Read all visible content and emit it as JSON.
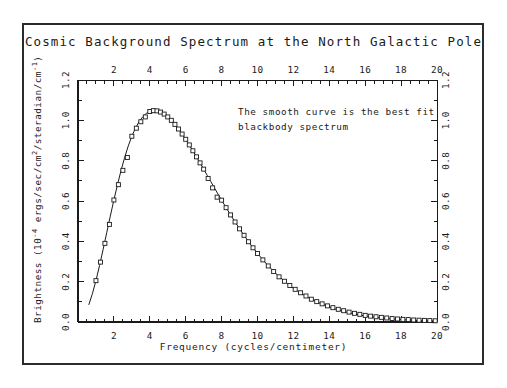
{
  "figure": {
    "title": "Cosmic Background Spectrum at the North Galactic Pole",
    "annotation_line1": "The smooth curve is the best fit",
    "annotation_line2": "blackbody spectrum"
  },
  "chart_data": {
    "type": "line",
    "title": "Cosmic Background Spectrum at the North Galactic Pole",
    "xlabel": "Frequency (cycles/centimeter)",
    "ylabel": "Brightness (10⁻⁴ ergs/sec/cm²/steradian/cm⁻¹)",
    "xlim": [
      0,
      20
    ],
    "ylim": [
      0.0,
      1.2
    ],
    "xticks": [
      2,
      4,
      6,
      8,
      10,
      12,
      14,
      16,
      18,
      20
    ],
    "xtick_labels": [
      "2",
      "4",
      "6",
      "8",
      "10",
      "12",
      "14",
      "16",
      "18",
      "20"
    ],
    "yticks": [
      0.0,
      0.2,
      0.4,
      0.6,
      0.8,
      1.0,
      1.2
    ],
    "ytick_labels": [
      "0.0",
      "0.2",
      "0.4",
      "0.6",
      "0.8",
      "1.0",
      "1.2"
    ],
    "x_minor_step": 0.5,
    "y_minor_step": 0.1,
    "grid": false,
    "legend": null,
    "top_axis_mirrored": true,
    "right_axis_mirrored": true,
    "annotations": [
      {
        "text": "The smooth curve is the best fit",
        "x": 11.2,
        "y": 1.02
      },
      {
        "text": "blackbody spectrum",
        "x": 11.2,
        "y": 0.94
      }
    ],
    "series": [
      {
        "name": "blackbody best fit",
        "style": "smooth-curve",
        "marker": "none",
        "x": [
          0.6,
          0.8,
          1.0,
          1.2,
          1.4,
          1.6,
          1.8,
          2.0,
          2.2,
          2.4,
          2.6,
          2.8,
          3.0,
          3.2,
          3.4,
          3.6,
          3.8,
          4.0,
          4.2,
          4.4,
          4.6,
          4.8,
          5.0,
          5.2,
          5.4,
          5.6,
          5.8,
          6.0,
          6.2,
          6.4,
          6.6,
          6.8,
          7.0,
          7.2,
          7.4,
          7.6,
          7.8,
          8.0,
          8.5,
          9.0,
          9.5,
          10.0,
          10.5,
          11.0,
          11.5,
          12.0,
          12.5,
          13.0,
          13.5,
          14.0,
          14.5,
          15.0,
          15.5,
          16.0,
          16.5,
          17.0,
          17.5,
          18.0,
          18.5,
          19.0,
          19.5,
          20.0
        ],
        "y": [
          0.085,
          0.14,
          0.205,
          0.28,
          0.36,
          0.443,
          0.525,
          0.605,
          0.681,
          0.752,
          0.816,
          0.873,
          0.921,
          0.961,
          0.993,
          1.017,
          1.034,
          1.044,
          1.048,
          1.047,
          1.041,
          1.031,
          1.017,
          1.0,
          0.98,
          0.957,
          0.932,
          0.906,
          0.878,
          0.849,
          0.819,
          0.789,
          0.758,
          0.727,
          0.696,
          0.665,
          0.634,
          0.604,
          0.531,
          0.462,
          0.398,
          0.34,
          0.288,
          0.242,
          0.202,
          0.167,
          0.138,
          0.113,
          0.092,
          0.074,
          0.06,
          0.048,
          0.038,
          0.03,
          0.024,
          0.019,
          0.015,
          0.012,
          0.009,
          0.007,
          0.006,
          0.005
        ]
      },
      {
        "name": "measured spectrum",
        "style": "points",
        "marker": "open-square",
        "x": [
          1.0,
          1.25,
          1.5,
          1.75,
          2.0,
          2.25,
          2.5,
          2.75,
          3.0,
          3.25,
          3.5,
          3.75,
          4.0,
          4.2,
          4.4,
          4.6,
          4.8,
          5.0,
          5.2,
          5.4,
          5.6,
          5.8,
          6.0,
          6.2,
          6.4,
          6.6,
          6.8,
          7.0,
          7.25,
          7.5,
          7.75,
          8.0,
          8.25,
          8.5,
          8.75,
          9.0,
          9.25,
          9.5,
          9.75,
          10.0,
          10.3,
          10.6,
          10.9,
          11.2,
          11.5,
          11.8,
          12.1,
          12.4,
          12.7,
          13.0,
          13.3,
          13.6,
          13.9,
          14.2,
          14.5,
          14.8,
          15.1,
          15.4,
          15.7,
          16.0,
          16.3,
          16.6,
          16.9,
          17.2,
          17.5,
          17.8,
          18.1,
          18.4,
          18.7,
          19.0,
          19.3,
          19.6,
          19.9
        ],
        "y": [
          0.205,
          0.297,
          0.39,
          0.484,
          0.605,
          0.681,
          0.752,
          0.816,
          0.921,
          0.961,
          0.993,
          1.017,
          1.044,
          1.048,
          1.047,
          1.041,
          1.031,
          1.017,
          1.0,
          0.98,
          0.957,
          0.932,
          0.906,
          0.878,
          0.849,
          0.819,
          0.789,
          0.758,
          0.712,
          0.665,
          0.619,
          0.604,
          0.567,
          0.531,
          0.496,
          0.462,
          0.43,
          0.398,
          0.368,
          0.34,
          0.308,
          0.278,
          0.25,
          0.224,
          0.202,
          0.181,
          0.162,
          0.145,
          0.129,
          0.113,
          0.101,
          0.09,
          0.08,
          0.071,
          0.063,
          0.056,
          0.049,
          0.043,
          0.038,
          0.033,
          0.029,
          0.026,
          0.023,
          0.02,
          0.017,
          0.015,
          0.013,
          0.012,
          0.01,
          0.009,
          0.008,
          0.007,
          0.006
        ]
      }
    ]
  }
}
